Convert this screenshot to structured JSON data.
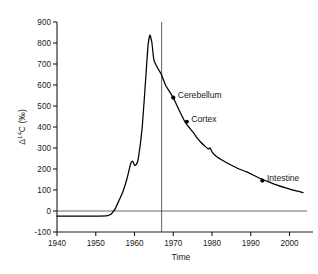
{
  "chart_data": {
    "type": "line",
    "title": "",
    "xlabel": "Time",
    "ylabel": "Δ C (‰)",
    "ylabel_prefix": "Δ",
    "ylabel_sup": "14",
    "ylabel_suffix": "C (‰)",
    "xlim": [
      1940,
      2004
    ],
    "ylim": [
      -100,
      900
    ],
    "xticks": [
      1940,
      1950,
      1960,
      1970,
      1980,
      1990,
      2000
    ],
    "xtick_labels": [
      "1940",
      "1950",
      "1960",
      "1970",
      "1980",
      "1990",
      "2000"
    ],
    "yticks": [
      -100,
      0,
      100,
      200,
      300,
      400,
      500,
      600,
      700,
      800,
      900
    ],
    "ytick_labels": [
      "-100",
      "0",
      "100",
      "200",
      "300",
      "400",
      "500",
      "600",
      "700",
      "800",
      "900"
    ],
    "grid": false,
    "legend": "none",
    "series": [
      {
        "name": "atmospheric-14c-bomb-curve",
        "color": "#000000",
        "x": [
          1940,
          1944,
          1948,
          1951,
          1953,
          1954,
          1955,
          1956,
          1957,
          1958,
          1959,
          1959.5,
          1960,
          1960.5,
          1961,
          1962,
          1963,
          1963.5,
          1964,
          1964.5,
          1965,
          1966,
          1967,
          1968,
          1969,
          1970,
          1971,
          1972,
          1973,
          1974,
          1975,
          1976,
          1977,
          1978,
          1979,
          1979.5,
          1980,
          1981,
          1983,
          1985,
          1987,
          1989,
          1991,
          1993,
          1995,
          1997,
          1999,
          2001,
          2003.5
        ],
        "y": [
          -24,
          -24,
          -24,
          -24,
          -22,
          -14,
          10,
          50,
          92,
          150,
          225,
          238,
          218,
          222,
          252,
          400,
          660,
          790,
          838,
          800,
          720,
          680,
          648,
          600,
          570,
          540,
          500,
          462,
          425,
          400,
          378,
          352,
          330,
          312,
          296,
          300,
          282,
          262,
          238,
          218,
          200,
          186,
          168,
          150,
          136,
          122,
          110,
          99,
          88
        ]
      }
    ],
    "reference_line": {
      "name": "1967-vertical-marker",
      "x": 1967,
      "orientation": "vertical",
      "color": "#4d4d4d"
    },
    "zero_line": {
      "name": "zero-horizontal-line",
      "y": 0,
      "color": "#595959"
    },
    "annotations": [
      {
        "label": "Cerebellum",
        "x": 1970,
        "y": 540
      },
      {
        "label": "Cortex",
        "x": 1973.5,
        "y": 425
      },
      {
        "label": "Intestine",
        "x": 1993,
        "y": 145
      }
    ]
  }
}
